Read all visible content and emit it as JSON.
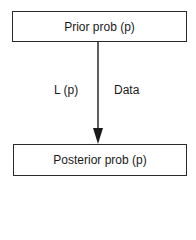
{
  "diagram": {
    "nodes": [
      {
        "id": "prior",
        "label": "Prior prob (p)"
      },
      {
        "id": "posterior",
        "label": "Posterior prob (p)"
      }
    ],
    "edge": {
      "from": "prior",
      "to": "posterior",
      "left_label": "L (p)",
      "right_label": "Data"
    },
    "colors": {
      "stroke": "#2a2a2a",
      "text": "#1a1a1a",
      "background": "#ffffff"
    }
  }
}
